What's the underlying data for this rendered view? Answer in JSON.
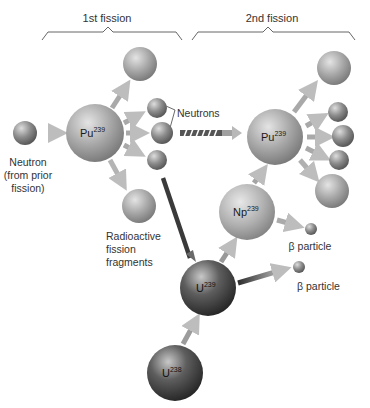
{
  "diagram": {
    "headings": {
      "first": "1st fission",
      "second": "2nd fission"
    },
    "labels": {
      "incoming_neutron_line1": "Neutron",
      "incoming_neutron_line2": "(from prior",
      "incoming_neutron_line3": "fission)",
      "neutrons": "Neutrons",
      "fragments_line1": "Radioactive",
      "fragments_line2": "fission",
      "fragments_line3": "fragments",
      "beta_1": "β particle",
      "beta_2": "β particle"
    },
    "nuclei": {
      "pu_first": {
        "symbol": "Pu",
        "mass": "239"
      },
      "pu_second": {
        "symbol": "Pu",
        "mass": "239"
      },
      "np": {
        "symbol": "Np",
        "mass": "239"
      },
      "u239": {
        "symbol": "U",
        "mass": "239"
      },
      "u238": {
        "symbol": "U",
        "mass": "238"
      }
    },
    "colors": {
      "background": "#ffffff",
      "sphere_light": "#d8d8d8",
      "sphere_mid": "#9a9a9a",
      "sphere_dark": "#3a3a3a",
      "arrow": "#9a9a9a",
      "arrow_dark": "#3c3c3c",
      "text": "#333333"
    }
  }
}
